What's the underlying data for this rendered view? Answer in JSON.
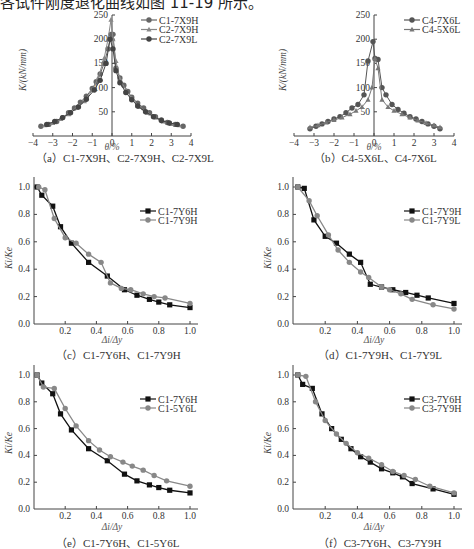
{
  "page": {
    "top_text": "各试件刚度退化曲线如图 11-19 所示。"
  },
  "chart_data": [
    {
      "id": "a",
      "type": "line",
      "caption": "（a）C1-7X9H、C2-7X9H、C2-7X9L",
      "xlabel": "θ/%",
      "ylabel": "K/(kN/mm)",
      "xlim": [
        -4,
        4
      ],
      "ylim": [
        0,
        250
      ],
      "xticks": [
        -4,
        -3,
        -2,
        -1,
        0,
        1,
        2,
        3,
        4
      ],
      "yticks": [
        50,
        100,
        150,
        200,
        250
      ],
      "legend_position": "upper right",
      "series": [
        {
          "name": "C1-7X9H",
          "marker": "circle",
          "color": "#666666",
          "x": [
            -3.6,
            -3.2,
            -2.8,
            -2.5,
            -2.2,
            -1.9,
            -1.6,
            -1.3,
            -1.0,
            -0.8,
            -0.6,
            -0.4,
            -0.2,
            -0.05,
            0.05,
            0.2,
            0.4,
            0.6,
            0.8,
            1.0,
            1.3,
            1.6,
            1.9,
            2.2,
            2.5,
            2.8,
            3.2,
            3.6
          ],
          "y": [
            20,
            24,
            30,
            38,
            48,
            58,
            70,
            82,
            98,
            112,
            128,
            150,
            180,
            210,
            210,
            140,
            120,
            105,
            92,
            80,
            68,
            58,
            48,
            40,
            33,
            28,
            24,
            20
          ]
        },
        {
          "name": "C2-7X9H",
          "marker": "triangle",
          "color": "#888888",
          "x": [
            -3.4,
            -3.0,
            -2.6,
            -2.2,
            -1.8,
            -1.4,
            -1.0,
            -0.7,
            -0.4,
            -0.2,
            -0.05,
            0.05,
            0.2,
            0.4,
            0.7,
            1.0,
            1.4,
            1.8,
            2.2,
            2.6,
            3.0,
            3.4
          ],
          "y": [
            22,
            27,
            35,
            45,
            58,
            72,
            95,
            120,
            160,
            200,
            240,
            200,
            155,
            118,
            95,
            78,
            60,
            48,
            38,
            30,
            25,
            22
          ]
        },
        {
          "name": "C2-7X9L",
          "marker": "circle",
          "color": "#444444",
          "x": [
            -3.3,
            -2.9,
            -2.5,
            -2.1,
            -1.7,
            -1.3,
            -0.9,
            -0.6,
            -0.3,
            -0.1,
            0.05,
            0.2,
            0.4,
            0.7,
            1.0,
            1.3,
            1.7,
            2.1,
            2.5,
            2.9,
            3.3
          ],
          "y": [
            24,
            30,
            38,
            48,
            60,
            76,
            95,
            115,
            150,
            200,
            180,
            135,
            110,
            90,
            75,
            62,
            50,
            40,
            32,
            27,
            24
          ]
        }
      ]
    },
    {
      "id": "b",
      "type": "line",
      "caption": "（b）C4-5X6L、C4-7X6L",
      "xlabel": "θ/%",
      "ylabel": "K/(kN/mm)",
      "xlim": [
        -4,
        4
      ],
      "ylim": [
        0,
        250
      ],
      "xticks": [
        -4,
        -3,
        -2,
        -1,
        0,
        1,
        2,
        3,
        4
      ],
      "yticks": [
        50,
        100,
        150,
        200,
        250
      ],
      "legend_position": "upper right",
      "series": [
        {
          "name": "C4-7X6L",
          "marker": "circle",
          "color": "#555555",
          "x": [
            -3.2,
            -2.9,
            -2.6,
            -2.3,
            -2.0,
            -1.7,
            -1.4,
            -1.1,
            -0.8,
            -0.5,
            -0.3,
            -0.05,
            0.05,
            0.2,
            0.4,
            0.6,
            0.9,
            1.2,
            1.5,
            1.8,
            2.1,
            2.4,
            2.7,
            3.0,
            3.3
          ],
          "y": [
            15,
            20,
            25,
            30,
            35,
            40,
            48,
            58,
            65,
            85,
            155,
            195,
            160,
            158,
            100,
            85,
            65,
            55,
            47,
            40,
            35,
            30,
            25,
            20,
            15
          ]
        },
        {
          "name": "C4-5X6L",
          "marker": "triangle",
          "color": "#777777",
          "x": [
            -3.2,
            -2.8,
            -2.4,
            -2.0,
            -1.6,
            -1.2,
            -0.9,
            -0.6,
            -0.3,
            -0.1,
            0.05,
            0.2,
            0.4,
            0.7,
            1.0,
            1.4,
            1.8,
            2.2,
            2.6,
            3.0,
            3.3
          ],
          "y": [
            18,
            22,
            28,
            33,
            38,
            45,
            52,
            60,
            75,
            100,
            160,
            140,
            75,
            60,
            52,
            45,
            38,
            32,
            27,
            22,
            18
          ]
        }
      ]
    },
    {
      "id": "c",
      "type": "line",
      "caption": "（c）C1-7Y6H、C1-7Y9H",
      "xlabel": "Δi/Δy",
      "ylabel": "Ki/Ke",
      "xlim": [
        0,
        1.0
      ],
      "ylim": [
        0,
        1.0
      ],
      "xticks": [
        0.2,
        0.4,
        0.6,
        0.8,
        1.0
      ],
      "yticks": [
        0.0,
        0.2,
        0.4,
        0.6,
        0.8,
        1.0
      ],
      "legend_position": "upper right",
      "series": [
        {
          "name": "C1-7Y6H",
          "marker": "square",
          "color": "#111111",
          "x": [
            0.02,
            0.05,
            0.12,
            0.17,
            0.24,
            0.35,
            0.47,
            0.58,
            0.66,
            0.74,
            0.8,
            0.87,
            1.0
          ],
          "y": [
            1.0,
            0.94,
            0.86,
            0.71,
            0.59,
            0.45,
            0.35,
            0.25,
            0.21,
            0.18,
            0.16,
            0.14,
            0.12
          ]
        },
        {
          "name": "C1-7Y9H",
          "marker": "circle",
          "color": "#888888",
          "x": [
            0.03,
            0.07,
            0.13,
            0.2,
            0.27,
            0.35,
            0.43,
            0.49,
            0.56,
            0.62,
            0.7,
            0.77,
            0.84,
            1.0
          ],
          "y": [
            1.0,
            0.98,
            0.77,
            0.63,
            0.59,
            0.51,
            0.45,
            0.3,
            0.26,
            0.25,
            0.22,
            0.2,
            0.19,
            0.15
          ]
        }
      ]
    },
    {
      "id": "d",
      "type": "line",
      "caption": "（d）C1-7Y9H、C1-7Y9L",
      "xlabel": "Δi/Δy",
      "ylabel": "Ki/Ke",
      "xlim": [
        0,
        1.0
      ],
      "ylim": [
        0,
        1.0
      ],
      "xticks": [
        0.2,
        0.4,
        0.6,
        0.8,
        1.0
      ],
      "yticks": [
        0.0,
        0.2,
        0.4,
        0.6,
        0.8,
        1.0
      ],
      "legend_position": "upper right",
      "series": [
        {
          "name": "C1-7Y9H",
          "marker": "square",
          "color": "#111111",
          "x": [
            0.03,
            0.07,
            0.13,
            0.2,
            0.27,
            0.35,
            0.42,
            0.48,
            0.55,
            0.62,
            0.7,
            0.77,
            0.84,
            1.0
          ],
          "y": [
            1.0,
            0.99,
            0.76,
            0.64,
            0.59,
            0.51,
            0.45,
            0.29,
            0.27,
            0.25,
            0.23,
            0.21,
            0.19,
            0.15
          ]
        },
        {
          "name": "C1-7Y9L",
          "marker": "circle",
          "color": "#888888",
          "x": [
            0.03,
            0.1,
            0.15,
            0.22,
            0.28,
            0.35,
            0.42,
            0.47,
            0.55,
            0.6,
            0.67,
            0.74,
            0.87,
            1.0
          ],
          "y": [
            1.0,
            0.9,
            0.79,
            0.65,
            0.54,
            0.45,
            0.38,
            0.34,
            0.27,
            0.25,
            0.22,
            0.18,
            0.14,
            0.11
          ]
        }
      ]
    },
    {
      "id": "e",
      "type": "line",
      "caption": "（e）C1-7Y6H、C1-5Y6L",
      "xlabel": "Δi/Δy",
      "ylabel": "Ki/Ke",
      "xlim": [
        0,
        1.0
      ],
      "ylim": [
        0,
        1.0
      ],
      "xticks": [
        0.2,
        0.4,
        0.6,
        0.8,
        1.0
      ],
      "yticks": [
        0.0,
        0.2,
        0.4,
        0.6,
        0.8,
        1.0
      ],
      "legend_position": "upper right",
      "series": [
        {
          "name": "C1-7Y6H",
          "marker": "square",
          "color": "#111111",
          "x": [
            0.02,
            0.05,
            0.12,
            0.17,
            0.24,
            0.35,
            0.47,
            0.58,
            0.66,
            0.74,
            0.8,
            0.87,
            1.0
          ],
          "y": [
            1.0,
            0.94,
            0.86,
            0.71,
            0.59,
            0.45,
            0.36,
            0.26,
            0.21,
            0.18,
            0.16,
            0.14,
            0.12
          ]
        },
        {
          "name": "C1-5Y6L",
          "marker": "circle",
          "color": "#888888",
          "x": [
            0.02,
            0.06,
            0.13,
            0.2,
            0.27,
            0.35,
            0.42,
            0.49,
            0.57,
            0.63,
            0.7,
            0.77,
            0.85,
            1.0
          ],
          "y": [
            1.0,
            0.91,
            0.9,
            0.75,
            0.62,
            0.51,
            0.44,
            0.39,
            0.35,
            0.32,
            0.29,
            0.25,
            0.21,
            0.17
          ]
        }
      ]
    },
    {
      "id": "f",
      "type": "line",
      "caption": "（f）C3-7Y6H、C3-7Y9H",
      "xlabel": "Δi/Δy",
      "ylabel": "Ki/Ke",
      "xlim": [
        0,
        1.0
      ],
      "ylim": [
        0,
        1.0
      ],
      "xticks": [
        0.2,
        0.4,
        0.6,
        0.8,
        1.0
      ],
      "yticks": [
        0.0,
        0.2,
        0.4,
        0.6,
        0.8,
        1.0
      ],
      "legend_position": "upper right",
      "series": [
        {
          "name": "C3-7Y6H",
          "marker": "square",
          "color": "#111111",
          "x": [
            0.03,
            0.06,
            0.12,
            0.18,
            0.24,
            0.3,
            0.36,
            0.42,
            0.48,
            0.55,
            0.62,
            0.68,
            0.74,
            0.87,
            1.0
          ],
          "y": [
            1.0,
            0.93,
            0.9,
            0.71,
            0.6,
            0.52,
            0.45,
            0.39,
            0.35,
            0.3,
            0.27,
            0.24,
            0.19,
            0.15,
            0.11
          ]
        },
        {
          "name": "C3-7Y9H",
          "marker": "circle",
          "color": "#888888",
          "x": [
            0.03,
            0.08,
            0.14,
            0.2,
            0.27,
            0.33,
            0.4,
            0.47,
            0.55,
            0.62,
            0.69,
            0.76,
            0.85,
            1.0
          ],
          "y": [
            1.0,
            0.99,
            0.8,
            0.66,
            0.56,
            0.49,
            0.42,
            0.38,
            0.33,
            0.28,
            0.25,
            0.22,
            0.17,
            0.12
          ]
        }
      ]
    }
  ]
}
